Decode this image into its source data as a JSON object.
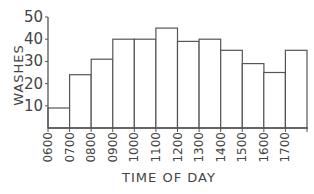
{
  "chart_data": {
    "type": "bar",
    "title": "",
    "xlabel": "TIME OF DAY",
    "ylabel": "WASHES",
    "categories": [
      "0600",
      "0700",
      "0800",
      "0900",
      "1000",
      "1100",
      "1200",
      "1300",
      "1400",
      "1500",
      "1600",
      "1700"
    ],
    "values": [
      9,
      24,
      31,
      40,
      40,
      45,
      39,
      40,
      35,
      29,
      25,
      35
    ],
    "ylim": [
      0,
      50
    ],
    "yticks": [
      10,
      20,
      30,
      40,
      50
    ],
    "grid": false,
    "legend": null,
    "style": {
      "bar_fill": "#ffffff",
      "bar_stroke": "#555555",
      "axis_color": "#555555"
    }
  }
}
